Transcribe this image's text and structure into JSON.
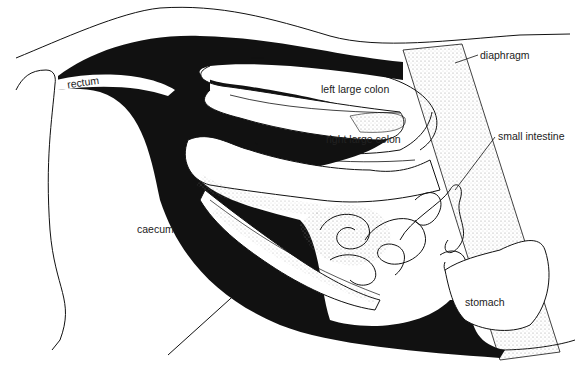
{
  "diagram": {
    "labels": {
      "rectum": "rectum",
      "diaphragm": "diaphragm",
      "left_large_colon": "left large colon",
      "right_large_colon": "right large colon",
      "small_intestine": "small intestine",
      "caecum": "caecum",
      "stomach": "stomach"
    },
    "colors": {
      "ink": "#111111",
      "stipple": "#bdbdbd",
      "background": "#ffffff"
    }
  }
}
